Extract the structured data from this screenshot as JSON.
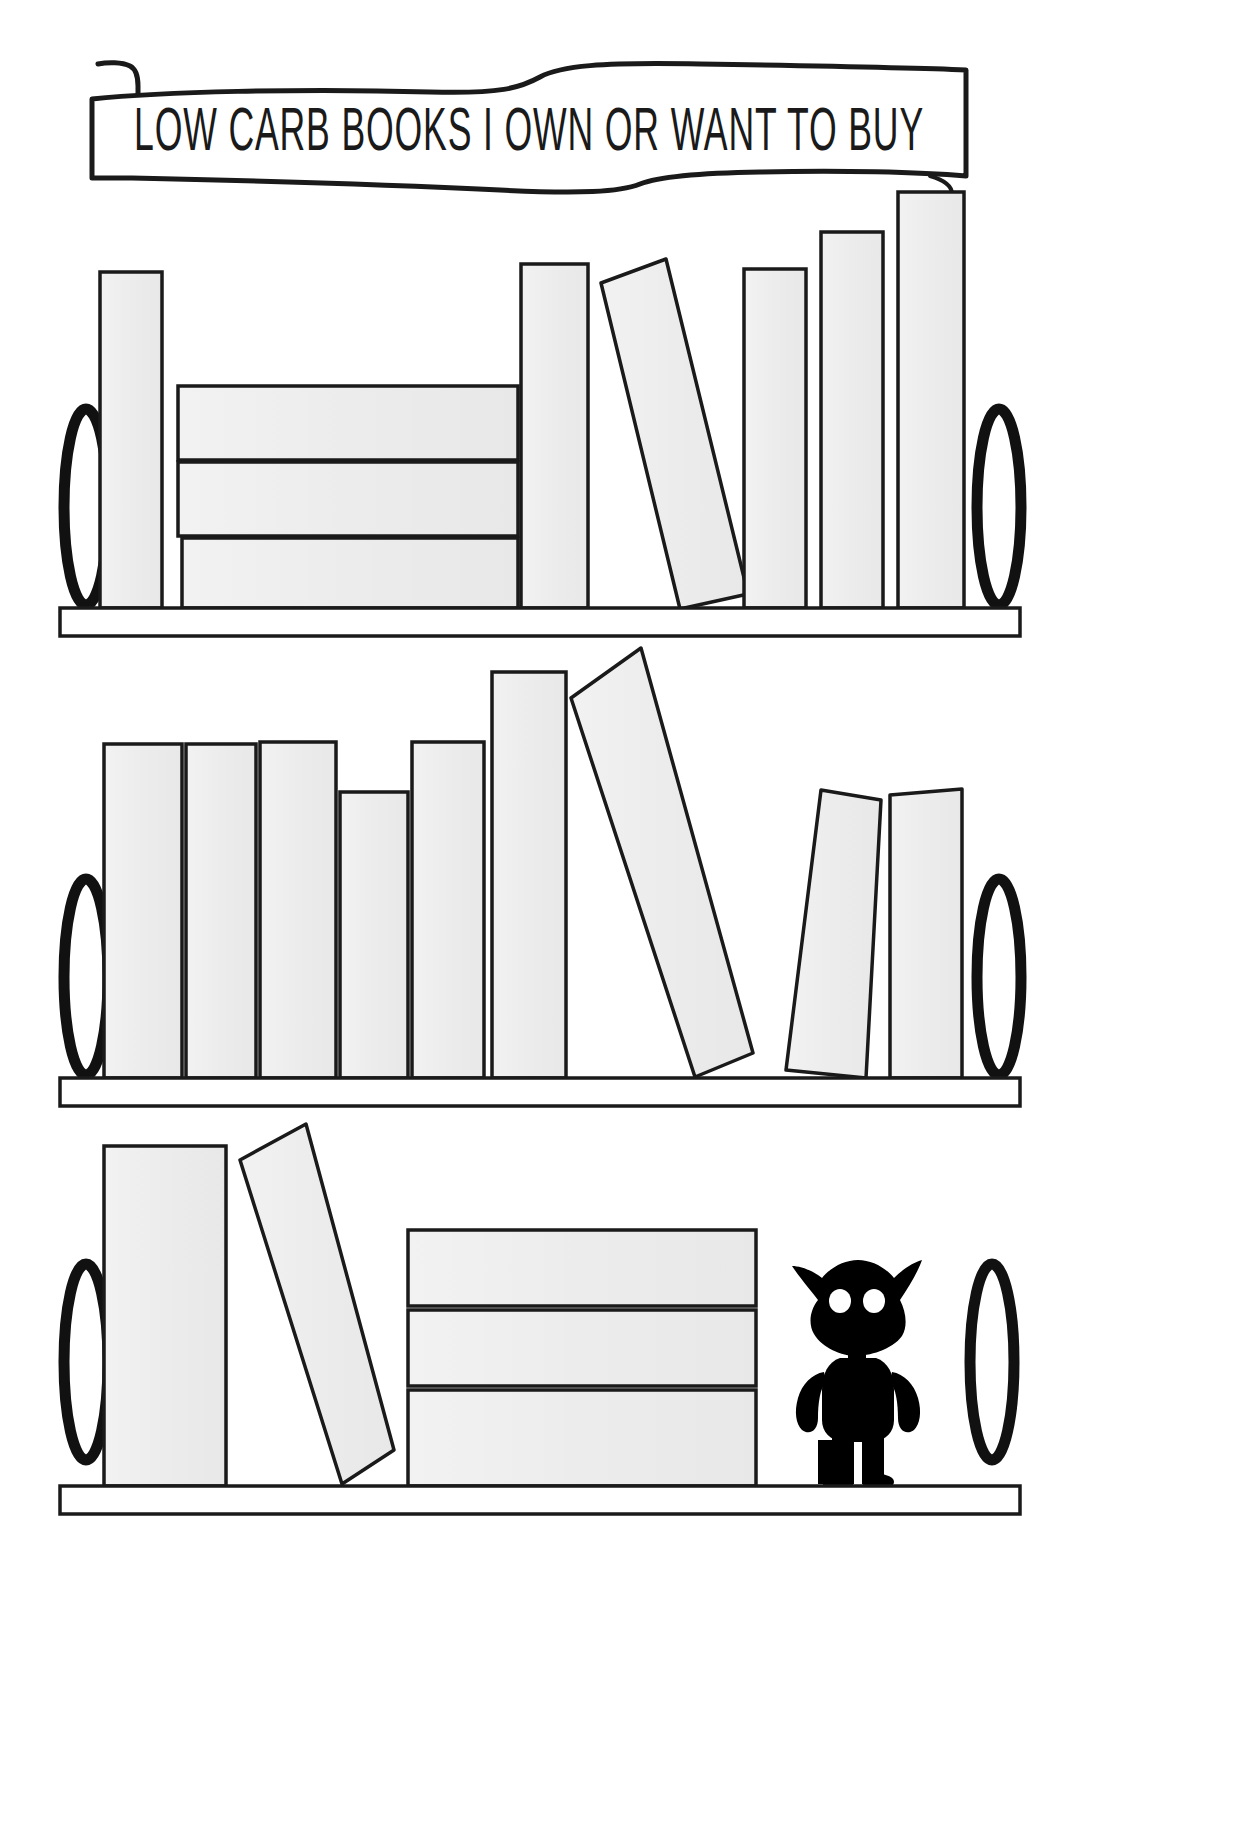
{
  "page": {
    "width": 1252,
    "height": 1826,
    "background_color": "#ffffff",
    "ink_color": "#1a1a1a",
    "book_fill_color": "#eeeeee",
    "book_outline_color": "#1a1a1a",
    "shelf_fill_color": "#ffffff",
    "figure_color": "#000000"
  },
  "banner": {
    "title": "LOW CARB BOOKS I OWN OR WANT TO BUY",
    "style": "ribbon-scroll",
    "font_look": "art-deco-condensed-caps",
    "x": 88,
    "y": 60,
    "width": 880,
    "height": 130
  },
  "shelves": [
    {
      "id": "shelf-top",
      "index": 1,
      "board": {
        "x": 60,
        "y": 608,
        "width": 960,
        "height": 28
      },
      "bookends": [
        {
          "id": "bookend-left-1",
          "cx": 86,
          "cy": 507,
          "rx": 22,
          "ry": 98
        },
        {
          "id": "bookend-right-1",
          "cx": 999,
          "cy": 507,
          "rx": 22,
          "ry": 98
        }
      ],
      "books": [
        {
          "id": "t1",
          "type": "upright",
          "x": 100,
          "y": 272,
          "width": 62,
          "height": 336
        },
        {
          "id": "t2",
          "type": "stacked-flat",
          "x": 178,
          "y": 386,
          "width": 340,
          "height": 74
        },
        {
          "id": "t3",
          "type": "stacked-flat",
          "x": 178,
          "y": 462,
          "width": 340,
          "height": 74
        },
        {
          "id": "t4",
          "type": "stacked-flat",
          "x": 182,
          "y": 538,
          "width": 336,
          "height": 70
        },
        {
          "id": "t5",
          "type": "upright",
          "x": 521,
          "y": 264,
          "width": 67,
          "height": 344
        },
        {
          "id": "t6",
          "type": "tilted",
          "x": 600,
          "y": 258,
          "width": 72,
          "height": 350,
          "tilt_deg": 11
        },
        {
          "id": "t7",
          "type": "upright",
          "x": 744,
          "y": 269,
          "width": 62,
          "height": 339
        },
        {
          "id": "t8",
          "type": "upright",
          "x": 821,
          "y": 232,
          "width": 62,
          "height": 376
        },
        {
          "id": "t9",
          "type": "upright",
          "x": 898,
          "y": 192,
          "width": 66,
          "height": 416
        }
      ]
    },
    {
      "id": "shelf-middle",
      "index": 2,
      "board": {
        "x": 60,
        "y": 1078,
        "width": 960,
        "height": 28
      },
      "bookends": [
        {
          "id": "bookend-left-2",
          "cx": 86,
          "cy": 977,
          "rx": 22,
          "ry": 98
        },
        {
          "id": "bookend-right-2",
          "cx": 999,
          "cy": 977,
          "rx": 22,
          "ry": 98
        }
      ],
      "books": [
        {
          "id": "m1",
          "type": "upright",
          "x": 104,
          "y": 744,
          "width": 78,
          "height": 334
        },
        {
          "id": "m2",
          "type": "upright",
          "x": 186,
          "y": 744,
          "width": 70,
          "height": 334
        },
        {
          "id": "m3",
          "type": "upright",
          "x": 260,
          "y": 742,
          "width": 76,
          "height": 336
        },
        {
          "id": "m4",
          "type": "upright",
          "x": 340,
          "y": 792,
          "width": 68,
          "height": 286
        },
        {
          "id": "m5",
          "type": "upright",
          "x": 412,
          "y": 742,
          "width": 72,
          "height": 336
        },
        {
          "id": "m6",
          "type": "upright",
          "x": 492,
          "y": 672,
          "width": 74,
          "height": 406
        },
        {
          "id": "m7",
          "type": "tilted",
          "x": 574,
          "y": 648,
          "width": 76,
          "height": 430,
          "tilt_deg": 14
        },
        {
          "id": "m8",
          "type": "tilted",
          "x": 786,
          "y": 788,
          "width": 70,
          "height": 290,
          "tilt_deg": -7
        },
        {
          "id": "m9",
          "type": "upright",
          "x": 890,
          "y": 790,
          "width": 72,
          "height": 288
        }
      ]
    },
    {
      "id": "shelf-bottom",
      "index": 3,
      "board": {
        "x": 60,
        "y": 1486,
        "width": 960,
        "height": 28
      },
      "bookends": [
        {
          "id": "bookend-left-3",
          "cx": 86,
          "cy": 1362,
          "rx": 22,
          "ry": 98
        },
        {
          "id": "bookend-right-3",
          "cx": 992,
          "cy": 1362,
          "rx": 22,
          "ry": 98
        }
      ],
      "books": [
        {
          "id": "b1",
          "type": "upright",
          "x": 104,
          "y": 1146,
          "width": 122,
          "height": 340
        },
        {
          "id": "b2",
          "type": "tilted",
          "x": 238,
          "y": 1124,
          "width": 74,
          "height": 362,
          "tilt_deg": 10
        },
        {
          "id": "b3",
          "type": "stacked-flat",
          "x": 408,
          "y": 1230,
          "width": 348,
          "height": 76
        },
        {
          "id": "b4",
          "type": "stacked-flat",
          "x": 408,
          "y": 1310,
          "width": 348,
          "height": 76
        },
        {
          "id": "b5",
          "type": "stacked-flat",
          "x": 408,
          "y": 1390,
          "width": 348,
          "height": 96
        }
      ],
      "figure": {
        "id": "creature-figurine",
        "name": "black-imp-figure",
        "x": 790,
        "y": 1258,
        "width": 130,
        "height": 228,
        "eye_count": 2,
        "eye_color": "#ffffff"
      }
    }
  ],
  "legend": {
    "note_visible": false
  }
}
